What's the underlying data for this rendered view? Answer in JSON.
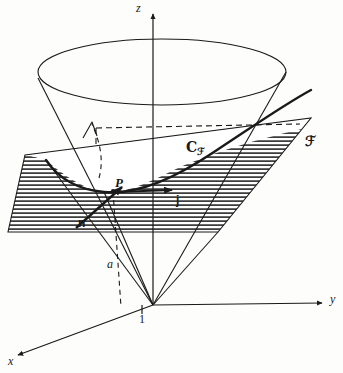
{
  "figure": {
    "background_color": "#fdfdfc",
    "stroke_color": "#1a1a1a",
    "hatch_color": "#1a1a1a"
  },
  "axes": {
    "z": {
      "label": "z",
      "style": "italic",
      "direction": "up"
    },
    "y": {
      "label": "y",
      "style": "italic",
      "direction": "right"
    },
    "x": {
      "label": "x",
      "style": "italic",
      "direction": "down-left"
    },
    "origin_tick": {
      "label": "1",
      "style": "upright"
    }
  },
  "labels": {
    "point_p": {
      "text": "P",
      "style": "italic"
    },
    "vector_n": {
      "text": "n",
      "style": "bold"
    },
    "vector_j": {
      "text": "j",
      "style": "bold"
    },
    "distance_a": {
      "text": "a",
      "style": "italic"
    },
    "curve": {
      "text": "C",
      "subscript": "ℱ",
      "style": "script"
    },
    "plane": {
      "text": "ℱ",
      "style": "fraktur"
    }
  },
  "geometry": {
    "cone": {
      "apex": {
        "x": 153,
        "y": 305
      },
      "top_ellipse": {
        "cx": 162,
        "cy": 72,
        "rx": 124,
        "ry": 33
      },
      "throat_note": "upper nappe opening upward from apex at origin"
    },
    "plane": {
      "name": "inclined-plane",
      "corners": [
        {
          "x": 25,
          "y": 155
        },
        {
          "x": 311,
          "y": 118
        },
        {
          "x": 218,
          "y": 232
        },
        {
          "x": 8,
          "y": 232
        }
      ],
      "hatched": true,
      "hatch_spacing_px": 4
    },
    "intersection_curve": {
      "name": "conic-section",
      "type": "parabola",
      "passes_through_point_p": true
    },
    "point_p": {
      "x": 113,
      "y": 190
    },
    "vector_j": {
      "from": {
        "x": 117,
        "y": 192
      },
      "to": {
        "x": 177,
        "y": 190
      }
    },
    "vector_n": {
      "from": {
        "x": 78,
        "y": 226
      },
      "to": {
        "x": 124,
        "y": 186
      }
    },
    "dashed_drop_line": {
      "from": {
        "x": 113,
        "y": 190
      },
      "to": {
        "x": 113,
        "y": 307
      }
    },
    "dashed_horizontal": {
      "from": {
        "x": 96,
        "y": 128
      },
      "to": {
        "x": 300,
        "y": 124
      }
    },
    "dashed_arc_arrow": {
      "note": "curved dashed arrow indicating plane tilt"
    }
  }
}
